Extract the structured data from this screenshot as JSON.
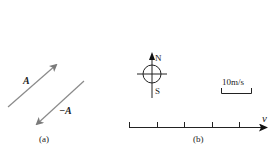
{
  "panel_a": {
    "caption": "(a)",
    "vector_label": "A",
    "neg_vector_label": "−A",
    "arrow_color": "#8a8a8a"
  },
  "panel_b": {
    "caption": "(b)",
    "compass": {
      "north": "N",
      "south": "S"
    },
    "scale_label": "10m/s",
    "axis_label": "v",
    "tick_count": 5
  }
}
